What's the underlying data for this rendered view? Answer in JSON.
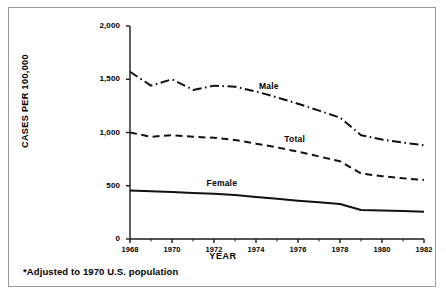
{
  "figure": {
    "footnote": "*Adjusted to 1970 U.S. population"
  },
  "chart_data": {
    "type": "line",
    "title": "",
    "xlabel": "YEAR",
    "ylabel": "CASES PER 100,000",
    "xlim": [
      1968,
      1982
    ],
    "ylim": [
      0,
      2000
    ],
    "grid": false,
    "legend_position": "inline-annotation",
    "x": [
      1968,
      1969,
      1970,
      1971,
      1972,
      1973,
      1974,
      1975,
      1976,
      1977,
      1978,
      1979,
      1980,
      1981,
      1982
    ],
    "ytick_labels": [
      "0",
      "500",
      "1,000",
      "1,500",
      "2,000"
    ],
    "ytick_values": [
      0,
      500,
      1000,
      1500,
      2000
    ],
    "xtick_labels": [
      "1968",
      "1970",
      "1972",
      "1974",
      "1976",
      "1978",
      "1980",
      "1982"
    ],
    "xtick_values": [
      1968,
      1970,
      1972,
      1974,
      1976,
      1978,
      1980,
      1982
    ],
    "xminor_values": [
      1969,
      1971,
      1973,
      1975,
      1977,
      1979,
      1981
    ],
    "series": [
      {
        "name": "Male",
        "style": "dash-dot",
        "label_x": 1974.1,
        "label_y": 1430,
        "values": [
          1570,
          1440,
          1500,
          1400,
          1440,
          1430,
          1385,
          1330,
          1270,
          1205,
          1140,
          975,
          935,
          905,
          880
        ]
      },
      {
        "name": "Total",
        "style": "dashed",
        "label_x": 1975.3,
        "label_y": 930,
        "values": [
          1000,
          960,
          975,
          960,
          950,
          930,
          895,
          860,
          820,
          775,
          730,
          615,
          590,
          570,
          555
        ]
      },
      {
        "name": "Female",
        "style": "solid",
        "label_x": 1971.6,
        "label_y": 520,
        "values": [
          455,
          448,
          442,
          432,
          425,
          412,
          395,
          378,
          360,
          345,
          328,
          272,
          268,
          262,
          255
        ]
      }
    ]
  }
}
